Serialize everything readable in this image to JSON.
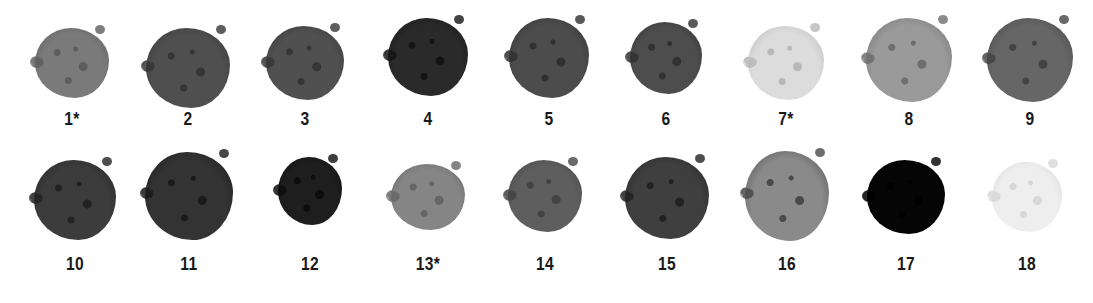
{
  "samples": [
    {
      "label": "1*",
      "shade": "#7a7a7a",
      "cx": 72,
      "cy": 63,
      "w": 74,
      "h": 70,
      "ly": 108,
      "texture": "#5e5e5e"
    },
    {
      "label": "2",
      "shade": "#4f4f4f",
      "cx": 188,
      "cy": 68,
      "w": 84,
      "h": 80,
      "ly": 108,
      "texture": "#353535"
    },
    {
      "label": "3",
      "shade": "#505050",
      "cx": 305,
      "cy": 63,
      "w": 78,
      "h": 74,
      "ly": 108,
      "texture": "#363636"
    },
    {
      "label": "4",
      "shade": "#2a2a2a",
      "cx": 428,
      "cy": 57,
      "w": 80,
      "h": 78,
      "ly": 108,
      "texture": "#141414"
    },
    {
      "label": "5",
      "shade": "#4c4c4c",
      "cx": 549,
      "cy": 58,
      "w": 80,
      "h": 80,
      "ly": 108,
      "texture": "#303030"
    },
    {
      "label": "6",
      "shade": "#4d4d4d",
      "cx": 666,
      "cy": 58,
      "w": 72,
      "h": 72,
      "ly": 108,
      "texture": "#323232"
    },
    {
      "label": "7*",
      "shade": "#dcdcdc",
      "cx": 786,
      "cy": 63,
      "w": 76,
      "h": 74,
      "ly": 108,
      "texture": "#b8b8b8"
    },
    {
      "label": "8",
      "shade": "#9a9a9a",
      "cx": 909,
      "cy": 60,
      "w": 86,
      "h": 84,
      "ly": 108,
      "texture": "#6e6e6e"
    },
    {
      "label": "9",
      "shade": "#666666",
      "cx": 1030,
      "cy": 60,
      "w": 86,
      "h": 84,
      "ly": 108,
      "texture": "#444444"
    },
    {
      "label": "10",
      "shade": "#3c3c3c",
      "cx": 75,
      "cy": 200,
      "w": 82,
      "h": 80,
      "ly": 253,
      "texture": "#222222"
    },
    {
      "label": "11",
      "shade": "#333333",
      "cx": 189,
      "cy": 196,
      "w": 88,
      "h": 88,
      "ly": 253,
      "texture": "#1b1b1b"
    },
    {
      "label": "12",
      "shade": "#1e1e1e",
      "cx": 310,
      "cy": 191,
      "w": 64,
      "h": 68,
      "ly": 253,
      "texture": "#0d0d0d"
    },
    {
      "label": "13*",
      "shade": "#858585",
      "cx": 428,
      "cy": 197,
      "w": 74,
      "h": 66,
      "ly": 253,
      "texture": "#666666"
    },
    {
      "label": "14",
      "shade": "#5e5e5e",
      "cx": 545,
      "cy": 196,
      "w": 74,
      "h": 72,
      "ly": 253,
      "texture": "#444444"
    },
    {
      "label": "15",
      "shade": "#3f3f3f",
      "cx": 667,
      "cy": 198,
      "w": 84,
      "h": 82,
      "ly": 253,
      "texture": "#222222"
    },
    {
      "label": "16",
      "shade": "#8a8a8a",
      "cx": 787,
      "cy": 196,
      "w": 84,
      "h": 90,
      "ly": 253,
      "texture": "#4a4a4a"
    },
    {
      "label": "17",
      "shade": "#050505",
      "cx": 906,
      "cy": 197,
      "w": 78,
      "h": 74,
      "ly": 253,
      "texture": "#000000"
    },
    {
      "label": "18",
      "shade": "#eeeeee",
      "cx": 1027,
      "cy": 197,
      "w": 70,
      "h": 70,
      "ly": 253,
      "texture": "#d8d8d8"
    }
  ],
  "colors": {
    "background": "#ffffff",
    "label": "#1a1a1a"
  }
}
